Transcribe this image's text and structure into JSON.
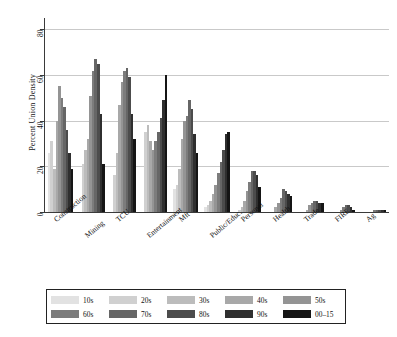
{
  "chart_data": {
    "type": "bar",
    "title": "",
    "xlabel": "",
    "ylabel": "Percent Union Density",
    "ylim": [
      0,
      85
    ],
    "yticks": [
      0,
      20,
      40,
      60,
      80
    ],
    "grid": "horizontal",
    "legend_position": "bottom",
    "categories": [
      "Construction",
      "Mining",
      "TCU",
      "Entertainment",
      "Mft",
      "Public/Educ.",
      "Personal",
      "Health",
      "Trade",
      "FIRE",
      "Ag"
    ],
    "series": [
      {
        "name": "10s",
        "color": "#e2e2e2",
        "values": [
          26,
          0,
          0,
          0,
          10,
          2,
          0,
          0,
          0,
          0,
          0
        ]
      },
      {
        "name": "20s",
        "color": "#d0d0d0",
        "values": [
          31,
          21,
          16,
          35,
          12,
          3,
          1,
          0,
          0,
          0,
          0
        ]
      },
      {
        "name": "30s",
        "color": "#bcbcbc",
        "values": [
          19,
          27,
          26,
          38,
          19,
          5,
          2,
          0,
          0,
          0,
          0
        ]
      },
      {
        "name": "40s",
        "color": "#a8a8a8",
        "values": [
          40,
          32,
          47,
          31,
          32,
          8,
          5,
          2,
          1,
          0,
          0
        ]
      },
      {
        "name": "50s",
        "color": "#949494",
        "values": [
          55,
          51,
          57,
          27,
          40,
          12,
          9,
          4,
          3,
          1,
          0
        ]
      },
      {
        "name": "60s",
        "color": "#7c7c7c",
        "values": [
          50,
          62,
          62,
          31,
          42,
          17,
          13,
          6,
          4,
          2,
          1
        ]
      },
      {
        "name": "70s",
        "color": "#666666",
        "values": [
          46,
          67,
          63,
          35,
          49,
          22,
          18,
          10,
          5,
          3,
          1
        ]
      },
      {
        "name": "80s",
        "color": "#4c4c4c",
        "values": [
          36,
          65,
          59,
          41,
          45,
          27,
          18,
          9,
          5,
          3,
          1
        ]
      },
      {
        "name": "90s",
        "color": "#2f2f2f",
        "values": [
          26,
          43,
          43,
          49,
          34,
          34,
          16,
          8,
          4,
          2,
          1
        ]
      },
      {
        "name": "00–15",
        "color": "#151515",
        "values": [
          19,
          21,
          32,
          60,
          26,
          35,
          11,
          7,
          4,
          1,
          1
        ]
      }
    ]
  },
  "legend": {
    "entries": [
      {
        "label": "10s",
        "color": "#e2e2e2"
      },
      {
        "label": "20s",
        "color": "#d0d0d0"
      },
      {
        "label": "30s",
        "color": "#bcbcbc"
      },
      {
        "label": "40s",
        "color": "#a8a8a8"
      },
      {
        "label": "50s",
        "color": "#949494"
      },
      {
        "label": "60s",
        "color": "#7c7c7c"
      },
      {
        "label": "70s",
        "color": "#666666"
      },
      {
        "label": "80s",
        "color": "#4c4c4c"
      },
      {
        "label": "90s",
        "color": "#2f2f2f"
      },
      {
        "label": "00–15",
        "color": "#151515"
      }
    ]
  }
}
